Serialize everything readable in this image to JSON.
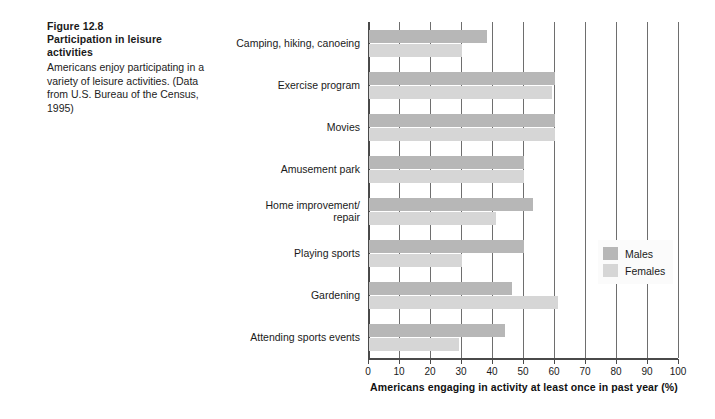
{
  "caption": {
    "figure_number": "Figure 12.8",
    "figure_title": "Participation in leisure activities",
    "body": "Americans enjoy participating in a variety of leisure activities. (Data from U.S. Bureau of the Census, 1995)"
  },
  "legend": {
    "position": "right-middle",
    "items": [
      {
        "label": "Males",
        "color": "#b7b7b7"
      },
      {
        "label": "Females",
        "color": "#d6d6d6"
      }
    ]
  },
  "colors": {
    "males": "#b7b7b7",
    "females": "#d6d6d6",
    "axis": "#4a4a4a",
    "grid": "#6e6e6e",
    "background": "#ffffff"
  },
  "chart_data": {
    "type": "bar",
    "orientation": "horizontal",
    "title": "Participation in leisure activities",
    "xlabel": "Americans engaging in activity at least once in past year (%)",
    "ylabel": "",
    "xlim": [
      0,
      100
    ],
    "xticks": [
      0,
      10,
      20,
      30,
      40,
      50,
      60,
      70,
      80,
      90,
      100
    ],
    "xtick_labels": [
      "0",
      "10",
      "20",
      "30",
      "40",
      "50",
      "60",
      "70",
      "80",
      "90",
      "100"
    ],
    "grid": true,
    "grid_axis": "x",
    "legend_position": "center right",
    "categories": [
      "Camping, hiking, canoeing",
      "Exercise program",
      "Movies",
      "Amusement park",
      "Home improvement/\nrepair",
      "Playing sports",
      "Gardening",
      "Attending sports events"
    ],
    "series": [
      {
        "name": "Males",
        "color": "#b7b7b7",
        "values": [
          38,
          60,
          60,
          50,
          53,
          50,
          46,
          44
        ]
      },
      {
        "name": "Females",
        "color": "#d6d6d6",
        "values": [
          30,
          59,
          60,
          50,
          41,
          30,
          61,
          29
        ]
      }
    ]
  }
}
